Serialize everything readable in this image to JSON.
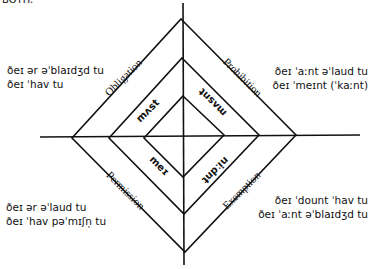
{
  "top_cutoff_text": "BOTH.",
  "diagram": {
    "quadrants": {
      "top_left": {
        "category": "Obligation",
        "modal": "mʌst",
        "phrases": [
          "ðeɪ ər əˈblaɪdʒd tu",
          "ðeɪ ˈhav tu"
        ]
      },
      "top_right": {
        "category": "Prohibition",
        "modal": "mʌsnt",
        "phrases": [
          "ðeɪ ˈaːnt əˈlaud tu",
          "ðeɪ ˈmeɪnt (ˈkaːnt)"
        ]
      },
      "bottom_left": {
        "category": "Permission",
        "modal": "meɪ",
        "phrases": [
          "ðeɪ ər əˈlaud tu",
          "ðeɪ ˈhav pəˈmɪʃn̩ tu"
        ]
      },
      "bottom_right": {
        "category": "Exemption",
        "modal": "niːdnt",
        "phrases": [
          "ðeɪ ˈdount ˈhav tu",
          "ðeɪ ˈaːnt əˈblaɪdʒd tu"
        ]
      }
    },
    "line_color": "#111111"
  }
}
